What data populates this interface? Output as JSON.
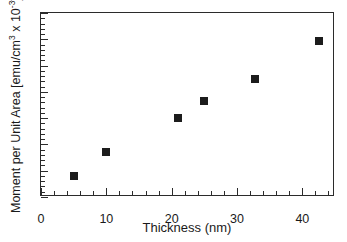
{
  "chart_data": {
    "type": "scatter",
    "title": "",
    "xlabel": "Thickness (nm)",
    "ylabel_plain": "Moment per Unit Area [emu/cm3 x 10-3]",
    "ylabel_parts": {
      "pre": "Moment per Unit Area [emu/cm",
      "sup1": "3",
      "mid": " x 10",
      "sup2": "-3",
      "post": "]"
    },
    "xlim": [
      0,
      45
    ],
    "ylim": [
      0,
      7
    ],
    "x_ticks": [
      0,
      10,
      20,
      30,
      40
    ],
    "x_ticklabels": [
      "0",
      "10",
      "20",
      "30",
      "40"
    ],
    "x_minor_interval": 2,
    "y_ticks": [
      0,
      1,
      2,
      3,
      4,
      5,
      6,
      7
    ],
    "y_ticklabels": [
      "0",
      "1",
      "2",
      "3",
      "4",
      "5",
      "6",
      "7"
    ],
    "y_minor_interval": 0.2,
    "grid": false,
    "legend": null,
    "marker": "square",
    "marker_color": "#1c1c1c",
    "marker_size_px": 8,
    "x": [
      5.0,
      10.0,
      21.0,
      25.0,
      32.8,
      42.6
    ],
    "y": [
      0.8,
      1.7,
      3.0,
      3.65,
      4.5,
      5.95
    ],
    "points": [
      {
        "x": 5.0,
        "y": 0.8
      },
      {
        "x": 10.0,
        "y": 1.7
      },
      {
        "x": 21.0,
        "y": 3.0
      },
      {
        "x": 25.0,
        "y": 3.65
      },
      {
        "x": 32.8,
        "y": 4.5
      },
      {
        "x": 42.6,
        "y": 5.95
      }
    ]
  },
  "style": {
    "axis_color": "#2b2b2b",
    "background": "#ffffff",
    "text_color": "#1a1a1a"
  }
}
